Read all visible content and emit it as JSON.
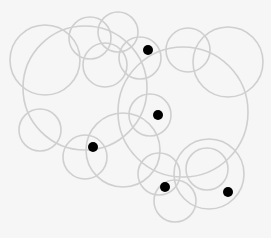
{
  "diagram": {
    "width": 271,
    "height": 238,
    "background": "#f6f6f6",
    "circle_stroke": "#cfcfcf",
    "circle_stroke_width": 1.6,
    "dot_color": "#000000",
    "dot_radius": 5,
    "circles": [
      {
        "cx": 45,
        "cy": 60,
        "r": 35
      },
      {
        "cx": 85,
        "cy": 88,
        "r": 62
      },
      {
        "cx": 90,
        "cy": 38,
        "r": 21
      },
      {
        "cx": 118,
        "cy": 32,
        "r": 20
      },
      {
        "cx": 105,
        "cy": 65,
        "r": 22
      },
      {
        "cx": 140,
        "cy": 58,
        "r": 21
      },
      {
        "cx": 188,
        "cy": 50,
        "r": 22
      },
      {
        "cx": 228,
        "cy": 62,
        "r": 35
      },
      {
        "cx": 183,
        "cy": 112,
        "r": 65
      },
      {
        "cx": 150,
        "cy": 115,
        "r": 21
      },
      {
        "cx": 40,
        "cy": 130,
        "r": 21
      },
      {
        "cx": 85,
        "cy": 157,
        "r": 22
      },
      {
        "cx": 123,
        "cy": 150,
        "r": 37
      },
      {
        "cx": 159,
        "cy": 174,
        "r": 21
      },
      {
        "cx": 175,
        "cy": 201,
        "r": 21
      },
      {
        "cx": 209,
        "cy": 174,
        "r": 35
      },
      {
        "cx": 207,
        "cy": 169,
        "r": 21
      }
    ],
    "dots": [
      {
        "cx": 148,
        "cy": 50
      },
      {
        "cx": 158,
        "cy": 115
      },
      {
        "cx": 93,
        "cy": 147
      },
      {
        "cx": 165,
        "cy": 187
      },
      {
        "cx": 228,
        "cy": 192
      }
    ]
  }
}
